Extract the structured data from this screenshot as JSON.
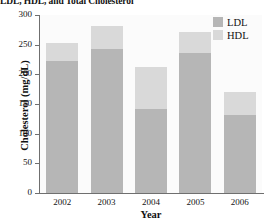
{
  "chart_data": {
    "type": "bar",
    "barmode": "stacked",
    "title": "LDL, HDL, and Total Cholesterol",
    "xlabel": "Year",
    "ylabel": "Cholesterol (mg/dL)",
    "categories": [
      "2002",
      "2003",
      "2004",
      "2005",
      "2006"
    ],
    "series": [
      {
        "name": "LDL",
        "color": "#b6b6b6",
        "values": [
          222,
          243,
          141,
          236,
          131
        ]
      },
      {
        "name": "HDL",
        "color": "#d9d9d9",
        "values": [
          30,
          38,
          71,
          35,
          40
        ]
      }
    ],
    "totals": [
      252,
      281,
      212,
      271,
      171
    ],
    "ylim": [
      0,
      300
    ],
    "yticks": [
      0,
      50,
      100,
      150,
      200,
      250,
      300
    ],
    "ytick_labels": [
      "0",
      "50",
      "100",
      "150",
      "200",
      "250",
      "300"
    ],
    "grid": false,
    "legend_position": "top-right",
    "legend": [
      "LDL",
      "HDL"
    ]
  }
}
